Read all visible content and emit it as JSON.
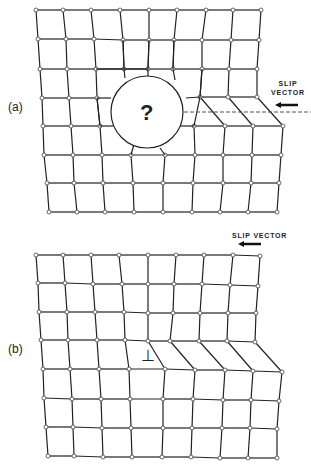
{
  "figure": {
    "panels": [
      {
        "id": "a",
        "label": "(a)",
        "slip_vector_label_line1": "SLIP",
        "slip_vector_label_line2": "VECTOR",
        "center_symbol": "?",
        "circle": {
          "cx": 147,
          "cy": 112,
          "r": 36
        },
        "dashed_line": {
          "x1": 184,
          "x2": 311,
          "y": 112
        },
        "arrow": {
          "x1": 298,
          "x2": 275,
          "y": 105
        },
        "rows": [
          [
            [
              36,
              10
            ],
            [
              63,
              10
            ],
            [
              91,
              10
            ],
            [
              120,
              10
            ],
            [
              149,
              10
            ],
            [
              177,
              10
            ],
            [
              206,
              10
            ],
            [
              233,
              10
            ],
            [
              261,
              10
            ]
          ],
          [
            [
              38,
              39
            ],
            [
              66,
              39
            ],
            [
              94,
              39
            ],
            [
              123,
              40
            ],
            [
              149,
              40
            ],
            [
              174,
              40
            ],
            [
              202,
              40
            ],
            [
              231,
              40
            ],
            [
              259,
              40
            ]
          ],
          [
            [
              40,
              69
            ],
            [
              67,
              69
            ],
            [
              96,
              69
            ],
            [
              124,
              69
            ],
            [
              148,
              69
            ],
            [
              173,
              69
            ],
            [
              202,
              69
            ],
            [
              229,
              69
            ],
            [
              257,
              69
            ]
          ],
          [
            [
              42,
              98
            ],
            [
              69,
              98
            ],
            [
              97,
              98
            ],
            [
              null,
              null
            ],
            [
              null,
              null
            ],
            [
              null,
              null
            ],
            [
              200,
              97
            ],
            [
              228,
              97
            ],
            [
              257,
              97
            ]
          ],
          [
            [
              43,
              126
            ],
            [
              71,
              126
            ],
            [
              100,
              126
            ],
            [
              null,
              null
            ],
            [
              null,
              null
            ],
            [
              194,
              126
            ],
            [
              225,
              126
            ],
            [
              253,
              126
            ],
            [
              283,
              126
            ]
          ],
          [
            [
              44,
              155
            ],
            [
              73,
              155
            ],
            [
              102,
              155
            ],
            [
              131,
              155
            ],
            [
              165,
              155
            ],
            [
              195,
              155
            ],
            [
              223,
              155
            ],
            [
              252,
              155
            ],
            [
              281,
              155
            ]
          ],
          [
            [
              47,
              183
            ],
            [
              74,
              183
            ],
            [
              103,
              183
            ],
            [
              133,
              183
            ],
            [
              163,
              183
            ],
            [
              193,
              183
            ],
            [
              223,
              183
            ],
            [
              251,
              183
            ],
            [
              279,
              183
            ]
          ],
          [
            [
              49,
              212
            ],
            [
              77,
              212
            ],
            [
              105,
              212
            ],
            [
              134,
              212
            ],
            [
              163,
              212
            ],
            [
              192,
              212
            ],
            [
              220,
              212
            ],
            [
              248,
              212
            ],
            [
              277,
              212
            ]
          ]
        ]
      },
      {
        "id": "b",
        "label": "(b)",
        "slip_vector_label": "SLIP VECTOR",
        "center_symbol": "⊥",
        "arrow": {
          "x1": 261,
          "x2": 238,
          "y": 244
        },
        "rows": [
          [
            [
              36,
              255
            ],
            [
              63,
              255
            ],
            [
              91,
              255
            ],
            [
              119,
              255
            ],
            [
              148,
              255
            ],
            [
              176,
              255
            ],
            [
              204,
              255
            ],
            [
              233,
              255
            ],
            [
              260,
              256
            ]
          ],
          [
            [
              38,
              283
            ],
            [
              65,
              283
            ],
            [
              93,
              284
            ],
            [
              122,
              284
            ],
            [
              148,
              284
            ],
            [
              174,
              284
            ],
            [
              202,
              284
            ],
            [
              230,
              285
            ],
            [
              258,
              286
            ]
          ],
          [
            [
              39,
              312
            ],
            [
              67,
              312
            ],
            [
              95,
              312
            ],
            [
              124,
              312
            ],
            [
              148,
              313
            ],
            [
              173,
              313
            ],
            [
              200,
              313
            ],
            [
              228,
              313
            ],
            [
              256,
              313
            ]
          ],
          [
            [
              41,
              340
            ],
            [
              68,
              340
            ],
            [
              97,
              340
            ],
            [
              125,
              340
            ],
            [
              148,
              341
            ],
            [
              170,
              341
            ],
            [
              199,
              341
            ],
            [
              227,
              341
            ],
            [
              255,
              342
            ]
          ],
          [
            [
              43,
              369
            ],
            [
              70,
              369
            ],
            [
              99,
              369
            ],
            [
              129,
              369
            ],
            [
              165,
              369
            ],
            [
              195,
              370
            ],
            [
              225,
              370
            ],
            [
              253,
              371
            ],
            [
              282,
              372
            ]
          ],
          [
            [
              44,
              398
            ],
            [
              72,
              399
            ],
            [
              101,
              399
            ],
            [
              130,
              399
            ],
            [
              163,
              399
            ],
            [
              193,
              399
            ],
            [
              223,
              400
            ],
            [
              251,
              400
            ],
            [
              279,
              401
            ]
          ],
          [
            [
              46,
              427
            ],
            [
              73,
              427
            ],
            [
              102,
              428
            ],
            [
              131,
              428
            ],
            [
              163,
              428
            ],
            [
              192,
              428
            ],
            [
              222,
              428
            ],
            [
              250,
              428
            ],
            [
              277,
              429
            ]
          ],
          [
            [
              48,
              456
            ],
            [
              74,
              456
            ],
            [
              103,
              457
            ],
            [
              132,
              457
            ],
            [
              162,
              457
            ],
            [
              191,
              457
            ],
            [
              220,
              458
            ],
            [
              248,
              458
            ],
            [
              277,
              458
            ]
          ]
        ]
      }
    ]
  }
}
